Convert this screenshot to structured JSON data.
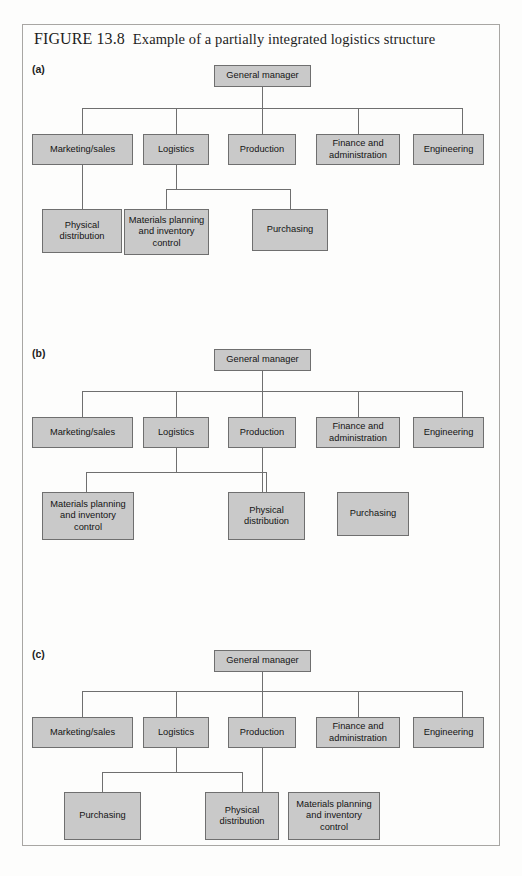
{
  "figure": {
    "number": "FIGURE 13.8",
    "caption": "Example of a partially integrated logistics structure"
  },
  "labels": {
    "node_general_manager": "General manager",
    "node_marketing_sales": "Marketing/sales",
    "node_logistics": "Logistics",
    "node_production": "Production",
    "node_finance": "Finance and administration",
    "node_engineering": "Engineering",
    "node_physical_distribution": "Physical distribution",
    "node_materials_planning": "Materials planning and inventory control",
    "node_purchasing": "Purchasing"
  },
  "panels": [
    {
      "id": "a",
      "label": "(a)",
      "root": "General manager",
      "level2": [
        "Marketing/sales",
        "Logistics",
        "Production",
        "Finance and administration",
        "Engineering"
      ],
      "level3": [
        {
          "parent": "Marketing/sales",
          "children": [
            "Physical distribution"
          ]
        },
        {
          "parent": "Logistics",
          "children": [
            "Materials planning and inventory control",
            "Purchasing"
          ]
        }
      ]
    },
    {
      "id": "b",
      "label": "(b)",
      "root": "General manager",
      "level2": [
        "Marketing/sales",
        "Logistics",
        "Production",
        "Finance and administration",
        "Engineering"
      ],
      "level3": [
        {
          "parent": "Logistics",
          "children": [
            "Materials planning and inventory control",
            "Physical distribution"
          ]
        },
        {
          "parent": "Production",
          "children": [
            "Purchasing"
          ]
        }
      ]
    },
    {
      "id": "c",
      "label": "(c)",
      "root": "General manager",
      "level2": [
        "Marketing/sales",
        "Logistics",
        "Production",
        "Finance and administration",
        "Engineering"
      ],
      "level3": [
        {
          "parent": "Logistics",
          "children": [
            "Purchasing",
            "Physical distribution"
          ]
        },
        {
          "parent": "Production",
          "children": [
            "Materials planning and inventory control"
          ]
        }
      ]
    }
  ],
  "colors": {
    "node_fill": "#c9c9c9",
    "node_border": "#6f6f6f",
    "frame_border": "#a8a6a3",
    "page_background": "#fdfdfc",
    "text": "#141414"
  }
}
